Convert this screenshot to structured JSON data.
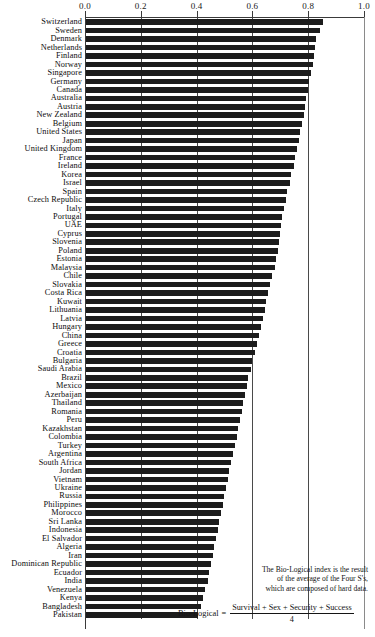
{
  "chart_data": {
    "type": "bar",
    "orientation": "horizontal",
    "title": "",
    "xlabel": "",
    "ylabel": "",
    "xlim": [
      0.0,
      1.0
    ],
    "grid": true,
    "legend": false,
    "axis_position": "top",
    "tick_labels": [
      "0.0",
      "0.2",
      "0.4",
      "0.6",
      "0.8",
      "1.0"
    ],
    "tick_values": [
      0.0,
      0.2,
      0.4,
      0.6,
      0.8,
      1.0
    ],
    "categories": [
      "Switzerland",
      "Sweden",
      "Denmark",
      "Netherlands",
      "Finland",
      "Norway",
      "Singapore",
      "Germany",
      "Canada",
      "Australia",
      "Austria",
      "New Zealand",
      "Belgium",
      "United States",
      "Japan",
      "United Kingdom",
      "France",
      "Ireland",
      "Korea",
      "Israel",
      "Spain",
      "Czech Republic",
      "Italy",
      "Portugal",
      "UAE",
      "Cyprus",
      "Slovenia",
      "Poland",
      "Estonia",
      "Malaysia",
      "Chile",
      "Slovakia",
      "Costa Rica",
      "Kuwait",
      "Lithuania",
      "Latvia",
      "Hungary",
      "China",
      "Greece",
      "Croatia",
      "Bulgaria",
      "Saudi Arabia",
      "Brazil",
      "Mexico",
      "Azerbaijan",
      "Thailand",
      "Romania",
      "Peru",
      "Kazakhstan",
      "Colombia",
      "Turkey",
      "Argentina",
      "South Africa",
      "Jordan",
      "Vietnam",
      "Ukraine",
      "Russia",
      "Philippines",
      "Morocco",
      "Sri Lanka",
      "Indonesia",
      "El Salvador",
      "Algeria",
      "Iran",
      "Dominican Republic",
      "Ecuador",
      "India",
      "Venezuela",
      "Kenya",
      "Bangladesh",
      "Pakistan"
    ],
    "values": [
      0.85,
      0.838,
      0.826,
      0.822,
      0.818,
      0.812,
      0.806,
      0.8,
      0.794,
      0.788,
      0.784,
      0.78,
      0.774,
      0.768,
      0.762,
      0.756,
      0.75,
      0.744,
      0.736,
      0.73,
      0.72,
      0.716,
      0.71,
      0.704,
      0.7,
      0.696,
      0.692,
      0.688,
      0.682,
      0.678,
      0.668,
      0.66,
      0.652,
      0.646,
      0.64,
      0.634,
      0.626,
      0.62,
      0.612,
      0.606,
      0.596,
      0.59,
      0.582,
      0.576,
      0.57,
      0.564,
      0.558,
      0.552,
      0.546,
      0.54,
      0.534,
      0.528,
      0.52,
      0.514,
      0.508,
      0.502,
      0.496,
      0.49,
      0.484,
      0.478,
      0.472,
      0.466,
      0.46,
      0.454,
      0.448,
      0.442,
      0.436,
      0.428,
      0.42,
      0.412,
      0.4
    ],
    "bar_color": "#1c1c1c",
    "annotation": {
      "lines": [
        "The Bio-Logical index is the result",
        "of the average of the Four S's,",
        "which are composed of hard data."
      ],
      "equation_label": "Bio-Logical",
      "equation_sign": "=",
      "numerator": "Survival + Sex + Security + Success",
      "denominator": "4"
    }
  }
}
